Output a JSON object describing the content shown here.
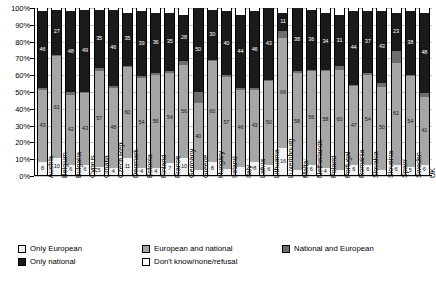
{
  "chart_data": {
    "type": "bar",
    "title": "",
    "subtitle": "",
    "xlabel": "",
    "ylabel": "",
    "stacked": true,
    "normalized": true,
    "grid": true,
    "legend_position": "bottom-left",
    "ylim": [
      0,
      100
    ],
    "yticks": [
      "0%",
      "10%",
      "20%",
      "30%",
      "40%",
      "50%",
      "60%",
      "70%",
      "80%",
      "90%",
      "100%"
    ],
    "categories": [
      "Austria",
      "Belgium",
      "Bulgaria",
      "Cyprus",
      "Croatia",
      "Czech Rep.",
      "Denmark",
      "Estonia",
      "Finland",
      "France",
      "Germany",
      "Greece",
      "Hungary",
      "Ireland",
      "Italy",
      "Latvia",
      "Lithuania",
      "Luxembourg",
      "Malta",
      "Netherlands",
      "Poland",
      "Portugal",
      "Romania",
      "Slovakia",
      "Slovenia",
      "Spain",
      "Sweden",
      "UK"
    ],
    "series": [
      {
        "name": "Only European",
        "color": "#f2f2f2",
        "values": [
          8,
          10,
          6,
          6,
          5,
          4,
          11,
          4,
          4,
          7,
          10,
          3,
          8,
          4,
          5,
          8,
          6,
          16,
          3,
          6,
          4,
          3,
          6,
          6,
          3,
          6,
          5,
          6
        ]
      },
      {
        "name": "European and national",
        "color": "#a6a6a6",
        "values": [
          43,
          61,
          42,
          43,
          57,
          48,
          60,
          54,
          56,
          54,
          56,
          40,
          60,
          57,
          46,
          43,
          50,
          66,
          58,
          56,
          58,
          60,
          47,
          54,
          50,
          61,
          54,
          41
        ]
      },
      {
        "name": "National and European",
        "color": "#6e6e6e",
        "values": [
          1,
          1,
          2,
          1,
          2,
          1,
          1,
          1,
          1,
          1,
          2,
          7,
          1,
          1,
          1,
          1,
          1,
          4,
          1,
          1,
          1,
          2,
          1,
          1,
          2,
          7,
          1,
          2
        ]
      },
      {
        "name": "Only national",
        "color": "#1a1a1a",
        "values": [
          46,
          27,
          48,
          49,
          35,
          46,
          35,
          39,
          36,
          35,
          28,
          50,
          30,
          40,
          44,
          46,
          43,
          11,
          38,
          36,
          34,
          31,
          44,
          37,
          43,
          23,
          38,
          48
        ]
      },
      {
        "name": "Don't know/none/refusal",
        "color": "#ffffff",
        "values": [
          2,
          1,
          2,
          1,
          1,
          1,
          3,
          2,
          3,
          3,
          4,
          0,
          1,
          2,
          4,
          2,
          0,
          3,
          0,
          1,
          3,
          4,
          2,
          2,
          2,
          3,
          2,
          3
        ]
      }
    ],
    "value_labels": {
      "only_european": [
        8,
        10,
        6,
        6,
        5,
        4,
        11,
        4,
        4,
        7,
        10,
        null,
        8,
        null,
        null,
        8,
        6,
        16,
        null,
        6,
        4,
        null,
        6,
        6,
        null,
        6,
        5,
        6
      ],
      "european_and_national": [
        43,
        61,
        42,
        43,
        57,
        48,
        60,
        54,
        56,
        54,
        56,
        40,
        60,
        57,
        46,
        43,
        50,
        66,
        58,
        56,
        58,
        60,
        47,
        54,
        50,
        61,
        54,
        41
      ],
      "only_national": [
        46,
        27,
        48,
        49,
        35,
        46,
        35,
        39,
        36,
        35,
        28,
        50,
        30,
        40,
        44,
        46,
        43,
        11,
        38,
        36,
        34,
        31,
        44,
        37,
        43,
        23,
        38,
        48
      ]
    }
  },
  "legend": {
    "row1": [
      {
        "label": "Only European",
        "key": "only-european"
      },
      {
        "label": "European and national",
        "key": "european-and-national"
      },
      {
        "label": "National and European",
        "key": "national-and-european"
      }
    ],
    "row2": [
      {
        "label": "Only national",
        "key": "only-national"
      },
      {
        "label": "Don't know/none/refusal",
        "key": "dont-know"
      }
    ]
  }
}
